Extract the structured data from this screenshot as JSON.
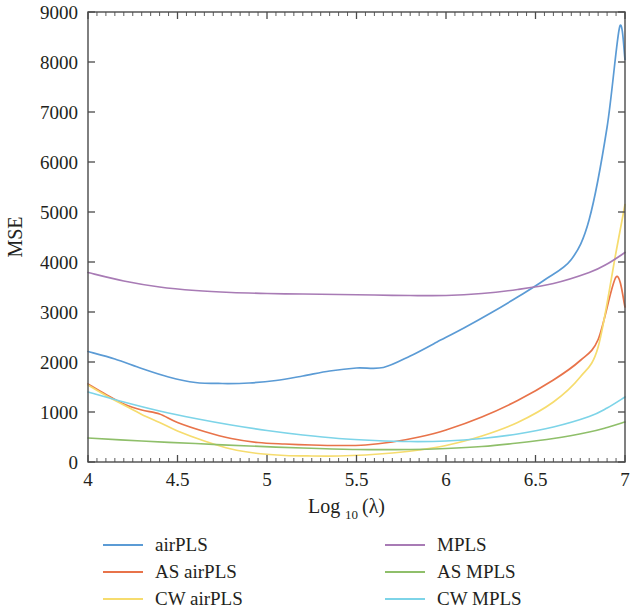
{
  "chart_data": {
    "type": "line",
    "title": "",
    "xlabel": "Log10 (λ)",
    "xlabel_base": "Log",
    "xlabel_sub": "10",
    "xlabel_arg": "(λ)",
    "ylabel": "MSE",
    "xlim": [
      4,
      7
    ],
    "ylim": [
      0,
      9000
    ],
    "xticks": [
      4,
      4.5,
      5,
      5.5,
      6,
      6.5,
      7
    ],
    "xtick_labels": [
      "4",
      "4.5",
      "5",
      "5.5",
      "6",
      "6.5",
      "7"
    ],
    "x_minor_step": 0.05,
    "yticks": [
      0,
      1000,
      2000,
      3000,
      4000,
      5000,
      6000,
      7000,
      8000,
      9000
    ],
    "ytick_labels": [
      "0",
      "1000",
      "2000",
      "3000",
      "4000",
      "5000",
      "6000",
      "7000",
      "8000",
      "9000"
    ],
    "grid": false,
    "legend_position": "below",
    "legend_columns": 2,
    "series": [
      {
        "name": "airPLS",
        "color": "#5B9BD5",
        "x": [
          4.0,
          4.15,
          4.3,
          4.45,
          4.6,
          4.75,
          4.9,
          5.05,
          5.2,
          5.35,
          5.5,
          5.65,
          5.8,
          5.95,
          6.1,
          6.25,
          6.4,
          6.55,
          6.7,
          6.8,
          6.9,
          6.97,
          7.0
        ],
        "y": [
          2210,
          2060,
          1870,
          1700,
          1590,
          1570,
          1580,
          1630,
          1720,
          1820,
          1880,
          1890,
          2120,
          2400,
          2680,
          2980,
          3300,
          3640,
          4050,
          4850,
          6700,
          8700,
          8050
        ]
      },
      {
        "name": "AS airPLS",
        "color": "#E8734A",
        "x": [
          4.0,
          4.1,
          4.2,
          4.3,
          4.4,
          4.5,
          4.65,
          4.8,
          4.95,
          5.1,
          5.25,
          5.4,
          5.55,
          5.7,
          5.85,
          6.0,
          6.2,
          6.4,
          6.6,
          6.75,
          6.85,
          6.95,
          7.0
        ],
        "y": [
          1560,
          1350,
          1160,
          1040,
          960,
          790,
          610,
          470,
          390,
          360,
          340,
          330,
          340,
          400,
          500,
          640,
          900,
          1230,
          1640,
          2030,
          2450,
          3700,
          3100
        ]
      },
      {
        "name": "CW airPLS",
        "color": "#F6DC6E",
        "x": [
          4.0,
          4.1,
          4.2,
          4.3,
          4.4,
          4.5,
          4.65,
          4.8,
          4.95,
          5.1,
          5.25,
          5.4,
          5.55,
          5.7,
          5.85,
          6.0,
          6.2,
          6.4,
          6.6,
          6.75,
          6.85,
          6.95,
          7.0
        ],
        "y": [
          1540,
          1330,
          1140,
          950,
          790,
          620,
          420,
          260,
          170,
          130,
          120,
          120,
          140,
          180,
          240,
          330,
          520,
          790,
          1200,
          1700,
          2300,
          4200,
          5150
        ]
      },
      {
        "name": "MPLS",
        "color": "#A87BB5",
        "x": [
          4.0,
          4.2,
          4.4,
          4.6,
          4.8,
          5.0,
          5.2,
          5.4,
          5.6,
          5.8,
          6.0,
          6.2,
          6.4,
          6.6,
          6.8,
          6.9,
          7.0
        ],
        "y": [
          3790,
          3620,
          3500,
          3430,
          3390,
          3370,
          3360,
          3350,
          3340,
          3330,
          3330,
          3370,
          3450,
          3570,
          3790,
          3960,
          4190
        ]
      },
      {
        "name": "AS MPLS",
        "color": "#8FBF6A",
        "x": [
          4.0,
          4.3,
          4.6,
          4.9,
          5.2,
          5.5,
          5.8,
          6.0,
          6.2,
          6.4,
          6.6,
          6.8,
          6.9,
          7.0
        ],
        "y": [
          480,
          420,
          370,
          320,
          280,
          250,
          250,
          270,
          310,
          380,
          470,
          600,
          690,
          800
        ]
      },
      {
        "name": "CW MPLS",
        "color": "#7DD4E8",
        "x": [
          4.0,
          4.2,
          4.4,
          4.6,
          4.8,
          5.0,
          5.2,
          5.4,
          5.6,
          5.8,
          6.0,
          6.2,
          6.4,
          6.6,
          6.8,
          6.9,
          7.0
        ],
        "y": [
          1400,
          1200,
          1020,
          870,
          740,
          630,
          540,
          470,
          430,
          410,
          420,
          470,
          560,
          700,
          910,
          1080,
          1300
        ]
      }
    ]
  },
  "legend": {
    "items": [
      {
        "label": "airPLS",
        "color": "#5B9BD5"
      },
      {
        "label": "MPLS",
        "color": "#A87BB5"
      },
      {
        "label": "AS airPLS",
        "color": "#E8734A"
      },
      {
        "label": "AS MPLS",
        "color": "#8FBF6A"
      },
      {
        "label": "CW airPLS",
        "color": "#F6DC6E"
      },
      {
        "label": "CW MPLS",
        "color": "#7DD4E8"
      }
    ]
  },
  "axes": {
    "y_title": "MSE",
    "x_title_base": "Log",
    "x_title_sub": "10",
    "x_title_arg": "(λ)"
  }
}
